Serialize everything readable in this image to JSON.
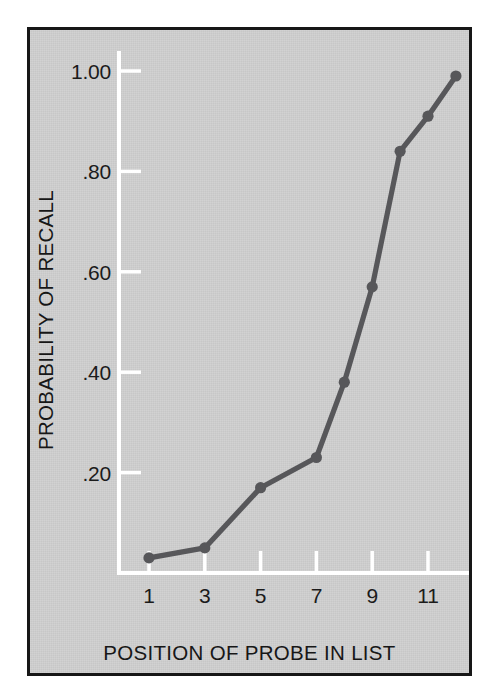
{
  "figure": {
    "background_color": "#cfcfcf",
    "border_color": "#171717",
    "axis_color": "#ffffff",
    "series_color": "#57575a",
    "text_color": "#171717"
  },
  "chart_data": {
    "type": "line",
    "title": "",
    "xlabel": "POSITION OF PROBE IN LIST",
    "ylabel": "PROBABILITY OF RECALL",
    "x": [
      1,
      3,
      5,
      7,
      8,
      9,
      10,
      11,
      12
    ],
    "values": [
      0.03,
      0.05,
      0.17,
      0.23,
      0.38,
      0.57,
      0.84,
      0.91,
      0.99
    ],
    "series": [
      {
        "name": "Probability of recall",
        "x": [
          1,
          3,
          5,
          7,
          8,
          9,
          10,
          11,
          12
        ],
        "values": [
          0.03,
          0.05,
          0.17,
          0.23,
          0.38,
          0.57,
          0.84,
          0.91,
          0.99
        ]
      }
    ],
    "xlim": [
      0.2,
      12.6
    ],
    "ylim": [
      0.0,
      1.04
    ],
    "xticks": [
      1,
      3,
      5,
      7,
      9,
      11
    ],
    "xtick_labels": [
      "1",
      "3",
      "5",
      "7",
      "9",
      "11"
    ],
    "yticks": [
      0.2,
      0.4,
      0.6,
      0.8,
      1.0
    ],
    "ytick_labels": [
      ".20",
      ".40",
      ".60",
      ".80",
      "1.00"
    ],
    "grid": false,
    "legend": null,
    "markers": "filled-circle",
    "annotations": []
  }
}
